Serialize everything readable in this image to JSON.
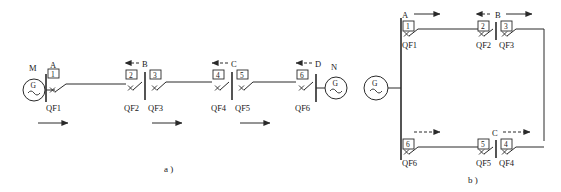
{
  "figure": {
    "captions": {
      "a": "a )",
      "b": "b )"
    }
  },
  "diagram_a": {
    "source_left_label": "M",
    "source_right_label": "N",
    "points": [
      {
        "name": "A",
        "arrow": "solid-right"
      },
      {
        "name": "B",
        "arrow": "dashed-left"
      },
      {
        "name": "C",
        "arrow": "dashed-left"
      },
      {
        "name": "D",
        "arrow": "dashed-left"
      }
    ],
    "breakers": [
      {
        "number": "1",
        "label": "QF1"
      },
      {
        "number": "2",
        "label": "QF2"
      },
      {
        "number": "3",
        "label": "QF3"
      },
      {
        "number": "4",
        "label": "QF4"
      },
      {
        "number": "5",
        "label": "QF5"
      },
      {
        "number": "6",
        "label": "QF6"
      }
    ],
    "flow_arrows": 3
  },
  "diagram_b": {
    "source_label": "G",
    "points": [
      {
        "name": "A",
        "arrow": "solid-right"
      },
      {
        "name": "B",
        "arrow": "dashed-left-and-solid-right"
      },
      {
        "name": "C",
        "arrow": "dashed-right"
      }
    ],
    "top_breakers": [
      {
        "number": "1",
        "label": "QF1"
      },
      {
        "number": "2",
        "label": "QF2"
      },
      {
        "number": "3",
        "label": "QF3"
      }
    ],
    "bottom_breakers": [
      {
        "number": "6",
        "label": "QF6"
      },
      {
        "number": "5",
        "label": "QF5"
      },
      {
        "number": "4",
        "label": "QF4"
      }
    ],
    "bottom_left_arrow": "dashed-right"
  },
  "colors": {
    "ink": "#2a2a2a",
    "paper": "#ffffff"
  }
}
